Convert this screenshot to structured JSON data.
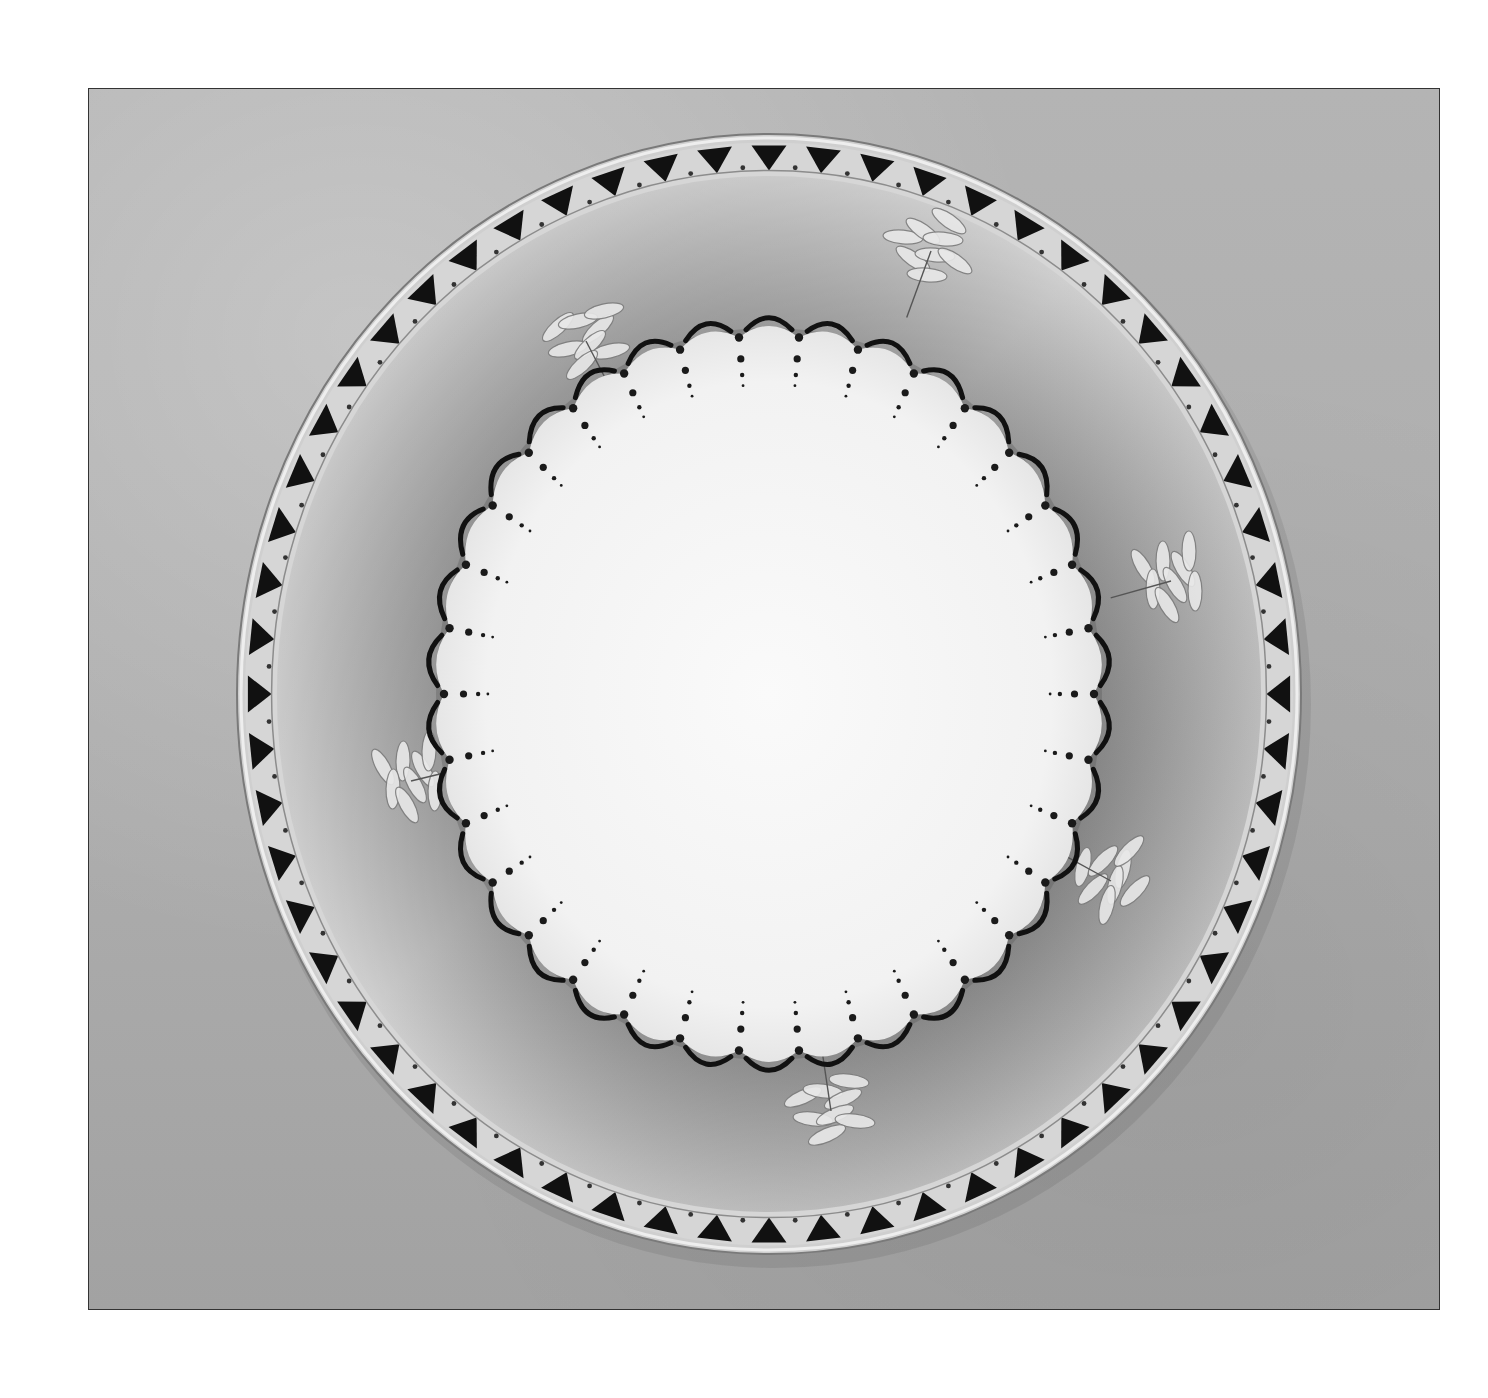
{
  "image": {
    "subject": "decorated porcelain plate on stand",
    "style": "black-and-white photograph",
    "frame": {
      "x": 88,
      "y": 88,
      "width": 1352,
      "height": 1222,
      "border": "#333333"
    }
  },
  "plate": {
    "center": [
      768,
      693
    ],
    "outer_radius": [
      532,
      560
    ],
    "rim_band": {
      "motif": "inward-pointing black triangles alternating with small dots",
      "triangle_count": 60,
      "color": "#111111"
    },
    "well": {
      "shade": "#9a9a9a",
      "motifs": [
        {
          "name": "floral-spray-top-right",
          "position": [
            930,
            250
          ]
        },
        {
          "name": "floral-spray-top-left",
          "position": [
            585,
            340
          ]
        },
        {
          "name": "floral-spray-right",
          "position": [
            1170,
            580
          ]
        },
        {
          "name": "floral-spray-left",
          "position": [
            410,
            780
          ]
        },
        {
          "name": "floral-spray-lower-right",
          "position": [
            1110,
            880
          ]
        },
        {
          "name": "floral-spray-bottom",
          "position": [
            830,
            1110
          ]
        }
      ]
    },
    "center_field": {
      "color": "#f7f7f7",
      "radius": [
        325,
        358
      ],
      "scallop_count": 34,
      "edge_motif": "black crescent arcs with radiating dot chains"
    }
  },
  "stand": {
    "position": [
      760,
      1225
    ],
    "material": "clear acrylic"
  },
  "colors": {
    "background": "#ffffff",
    "backdrop": "#acacac",
    "ink": "#111111",
    "porcelain": "#f7f7f7"
  }
}
